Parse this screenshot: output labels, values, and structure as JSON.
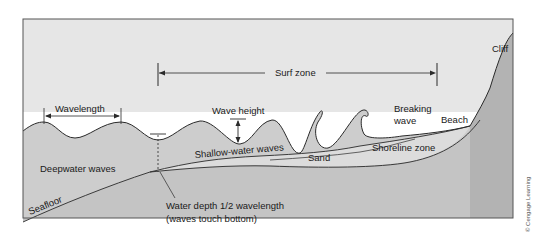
{
  "diagram": {
    "labels": {
      "surf_zone": "Surf zone",
      "wavelength": "Wavelength",
      "wave_height": "Wave height",
      "breaking_wave_line1": "Breaking",
      "breaking_wave_line2": "wave",
      "beach": "Beach",
      "cliff": "Cliff",
      "deepwater_waves": "Deepwater waves",
      "shallow_water_waves": "Shallow-water waves",
      "sand": "Sand",
      "shoreline_zone": "Shoreline zone",
      "seafloor": "Seafloor",
      "water_depth_line1": "Water depth 1/2 wavelength",
      "water_depth_line2": "(waves touch bottom)"
    },
    "credit": "© Cengage Learning",
    "colors": {
      "sky": "#e6e6e6",
      "water": "#c9c9c9",
      "sand": "#d9d9d9",
      "land": "#b8b8b8",
      "line": "#2a2a2a",
      "frame": "#555555"
    }
  }
}
